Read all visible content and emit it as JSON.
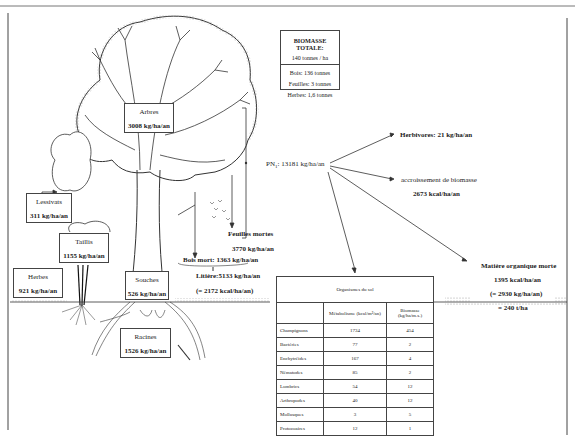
{
  "diagram": {
    "type": "forest ecosystem biomass and energy flow diagram",
    "biomass_total": {
      "title": "BIOMASSE TOTALE:",
      "value": "140 tonnes / ha",
      "items": [
        "Bois: 136 tonnes",
        "Feuilles: 3 tonnes",
        "Herbes: 1,6 tonnes"
      ]
    },
    "compartments": {
      "arbres": {
        "name": "Arbres",
        "value": "3008 kg/ha/an"
      },
      "lessivats": {
        "name": "Lessivats",
        "value": "311 kg/ha/an"
      },
      "taillis": {
        "name": "Taillis",
        "value": "1155 kg/ha/an"
      },
      "herbes": {
        "name": "Herbes",
        "value": "921 kg/ha/an"
      },
      "souches": {
        "name": "Souches",
        "value": "526 kg/ha/an"
      },
      "racines": {
        "name": "Racines",
        "value": "1526 kg/ha/an"
      }
    },
    "litter": {
      "feuilles_mortes": "Feuilles mortes",
      "feuilles_mortes_value": "3770 kg/ha/an",
      "bois_mort": "Bois mort: 1363 kg/ha/an",
      "litiere": "Litière:5133 kg/ha/an",
      "litiere_energy": "(= 2172 kcal/ha/an)"
    },
    "production": {
      "pn_label": "PN",
      "pn_sub": "1",
      "pn_value": ": 13181 kg/ha/an"
    },
    "flows": {
      "herbivores": "Herbivores: 21 kg/ha/an",
      "accroissement": "accroissement de biomasse",
      "accroissement_value": "2673 kcal/ha/an",
      "matiere_title": "Matière organique morte",
      "matiere_v1": "1395 kcal/ha/an",
      "matiere_v2": "(= 2930 kg/ha/an)",
      "matiere_v3": "= 240 t/ha"
    },
    "soil_table": {
      "title": "Organismes du sol",
      "headers": [
        "",
        "Métabolisme (kcal/m²/an)",
        "Biomasse (kg/ha/m.s.)"
      ],
      "rows": [
        {
          "name": "Champignons",
          "metabolisme": "1734",
          "biomasse": "454"
        },
        {
          "name": "Bactéries",
          "metabolisme": "77",
          "biomasse": "2"
        },
        {
          "name": "Enchytréides",
          "metabolisme": "167",
          "biomasse": "4"
        },
        {
          "name": "Nématodes",
          "metabolisme": "85",
          "biomasse": "2"
        },
        {
          "name": "Lombrics",
          "metabolisme": "54",
          "biomasse": "12"
        },
        {
          "name": "Arthropodes",
          "metabolisme": "40",
          "biomasse": "12"
        },
        {
          "name": "Mollusques",
          "metabolisme": "3",
          "biomasse": "5"
        },
        {
          "name": "Protozoaires",
          "metabolisme": "12",
          "biomasse": "1"
        }
      ]
    }
  }
}
